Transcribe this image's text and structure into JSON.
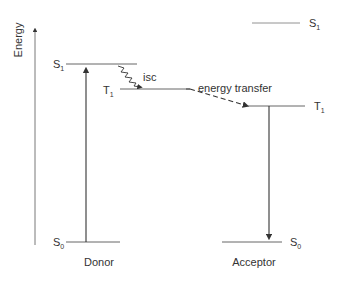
{
  "diagram": {
    "type": "energy-level diagram (Jablonski-style triplet-triplet energy transfer)",
    "axis": {
      "label": "Energy"
    },
    "donor": {
      "label": "Donor",
      "levels": [
        {
          "name": "S",
          "sub": "1"
        },
        {
          "name": "T",
          "sub": "1"
        },
        {
          "name": "S",
          "sub": "0"
        }
      ]
    },
    "acceptor": {
      "label": "Acceptor",
      "levels": [
        {
          "name": "S",
          "sub": "1"
        },
        {
          "name": "T",
          "sub": "1"
        },
        {
          "name": "S",
          "sub": "0"
        }
      ]
    },
    "processes": {
      "isc": "isc",
      "energy_transfer": "energy transfer"
    },
    "colors": {
      "line": "#333333",
      "thin_line": "#555555",
      "text": "#333333"
    }
  }
}
